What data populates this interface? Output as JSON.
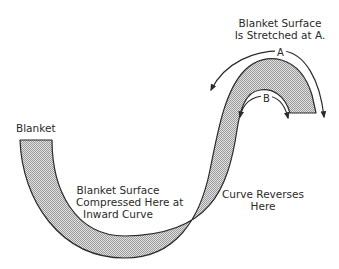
{
  "labels": {
    "blanket": "Blanket",
    "stretched_line1": "Blanket Surface",
    "stretched_line2": "Is Stretched at A.",
    "compressed_line1": "Blanket Surface",
    "compressed_line2": "Compressed Here at",
    "compressed_line3": "Inward Curve",
    "reverses_line1": "Curve Reverses",
    "reverses_line2": "Here",
    "arrow_a": "A",
    "arrow_b": "B"
  },
  "colors": {
    "outline": "#2a2a2a",
    "fill_pattern": "#b8b8b8",
    "background": "#ffffff"
  }
}
